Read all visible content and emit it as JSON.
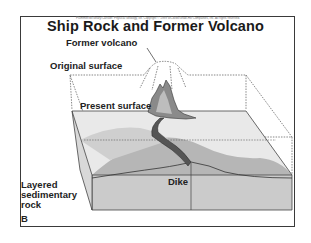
{
  "figure": {
    "copyright_line": "Plummer/McGeary/Carlson: Physical Geology, 8e. Copyright © 1999 WCB/McGraw-Hill Companies, Inc. All rights reserved.",
    "title": "Ship Rock and Former Volcano",
    "panel_letter": "B",
    "labels": {
      "former_volcano": "Former volcano",
      "original_surface": "Original surface",
      "present_surface": "Present surface",
      "dike": "Dike",
      "layered_rock_line1": "Layered",
      "layered_rock_line2": "sedimentary",
      "layered_rock_line3": "rock"
    },
    "colors": {
      "frame": "#3a3a3a",
      "block_side": "#c8c8c8",
      "block_top_light": "#e6e6e6",
      "rock_dark": "#7a7a7a",
      "text": "#222222"
    }
  }
}
